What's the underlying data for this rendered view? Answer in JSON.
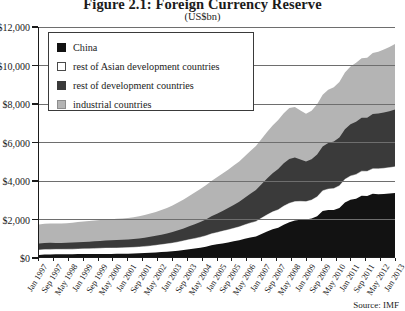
{
  "chart_data": {
    "type": "area",
    "stacked": true,
    "title": "Figure 2.1: Foreign Currency Reserve",
    "subtitle": "(US$bn)",
    "xlabel": "",
    "ylabel": "",
    "ylim": [
      0,
      12000
    ],
    "grid": true,
    "legend_position": "top-left",
    "source": "Source: IMF",
    "ytick_labels": [
      "$0",
      "$2,000",
      "$4,000",
      "$6,000",
      "$8,000",
      "$10,000",
      "$12,000"
    ],
    "ytick_values": [
      0,
      2000,
      4000,
      6000,
      8000,
      10000,
      12000
    ],
    "xtick_labels": [
      "Jan 1997",
      "Sep 1997",
      "May 1998",
      "Jan 1999",
      "Sep 1999",
      "May 2000",
      "Jan 2001",
      "Sep 2001",
      "May 2002",
      "Jan 2003",
      "Sep 2003",
      "May 2004",
      "Jan 2005",
      "Sep 2005",
      "May 2006",
      "Jan 2007",
      "Sep 2007",
      "May 2008",
      "Jan 2009",
      "Sep 2009",
      "May 2010",
      "Jan 2011",
      "Sep 2011",
      "May 2012",
      "Jan 2013"
    ],
    "x": [
      1997.0,
      1997.25,
      1997.5,
      1997.75,
      1998.0,
      1998.25,
      1998.5,
      1998.75,
      1999.0,
      1999.25,
      1999.5,
      1999.75,
      2000.0,
      2000.25,
      2000.5,
      2000.75,
      2001.0,
      2001.25,
      2001.5,
      2001.75,
      2002.0,
      2002.25,
      2002.5,
      2002.75,
      2003.0,
      2003.25,
      2003.5,
      2003.75,
      2004.0,
      2004.25,
      2004.5,
      2004.75,
      2005.0,
      2005.25,
      2005.5,
      2005.75,
      2006.0,
      2006.25,
      2006.5,
      2006.75,
      2007.0,
      2007.25,
      2007.5,
      2007.75,
      2008.0,
      2008.25,
      2008.5,
      2008.75,
      2009.0,
      2009.25,
      2009.5,
      2009.75,
      2010.0,
      2010.25,
      2010.5,
      2010.75,
      2011.0,
      2011.25,
      2011.5,
      2011.75,
      2012.0,
      2012.25,
      2012.5,
      2012.75,
      2013.0
    ],
    "series": [
      {
        "name": "China",
        "color": "#121212",
        "values": [
          110,
          125,
          135,
          140,
          145,
          146,
          148,
          150,
          152,
          154,
          156,
          158,
          160,
          162,
          164,
          168,
          175,
          185,
          198,
          212,
          225,
          240,
          258,
          278,
          300,
          330,
          365,
          403,
          440,
          480,
          530,
          610,
          660,
          710,
          760,
          818,
          875,
          950,
          1020,
          1066,
          1200,
          1330,
          1450,
          1528,
          1680,
          1810,
          1900,
          1946,
          1950,
          2010,
          2130,
          2399,
          2450,
          2450,
          2560,
          2847,
          2990,
          3045,
          3200,
          3181,
          3300,
          3280,
          3290,
          3310,
          3340
        ]
      },
      {
        "name": "rest of Asian development countries",
        "color": "#ffffff",
        "values": [
          260,
          265,
          262,
          258,
          255,
          258,
          262,
          268,
          275,
          282,
          290,
          298,
          305,
          308,
          310,
          312,
          315,
          320,
          330,
          340,
          355,
          372,
          390,
          408,
          430,
          455,
          480,
          505,
          530,
          555,
          580,
          600,
          620,
          640,
          660,
          680,
          700,
          730,
          760,
          790,
          830,
          870,
          905,
          940,
          975,
          995,
          990,
          960,
          940,
          965,
          1010,
          1060,
          1100,
          1125,
          1160,
          1205,
          1240,
          1265,
          1280,
          1290,
          1310,
          1325,
          1340,
          1355,
          1370
        ]
      },
      {
        "name": "rest of development countries",
        "color": "#3a3a3a",
        "values": [
          340,
          345,
          342,
          338,
          335,
          338,
          342,
          348,
          356,
          364,
          372,
          380,
          392,
          400,
          408,
          414,
          420,
          428,
          440,
          455,
          472,
          492,
          515,
          540,
          570,
          605,
          645,
          690,
          735,
          790,
          850,
          915,
          980,
          1055,
          1135,
          1220,
          1310,
          1415,
          1525,
          1640,
          1760,
          1890,
          2010,
          2120,
          2230,
          2310,
          2300,
          2180,
          2090,
          2120,
          2210,
          2310,
          2400,
          2455,
          2520,
          2610,
          2690,
          2750,
          2790,
          2800,
          2850,
          2880,
          2910,
          2940,
          2980
        ]
      },
      {
        "name": "industrial countries",
        "color": "#b4b4b4",
        "values": [
          990,
          1000,
          1005,
          1010,
          1015,
          1025,
          1040,
          1055,
          1070,
          1080,
          1090,
          1095,
          1100,
          1105,
          1110,
          1115,
          1125,
          1140,
          1160,
          1185,
          1215,
          1250,
          1290,
          1335,
          1390,
          1450,
          1515,
          1585,
          1655,
          1720,
          1785,
          1845,
          1900,
          1950,
          2000,
          2050,
          2100,
          2160,
          2225,
          2290,
          2360,
          2430,
          2500,
          2560,
          2620,
          2660,
          2640,
          2560,
          2500,
          2540,
          2620,
          2700,
          2780,
          2830,
          2890,
          2960,
          3020,
          3070,
          3100,
          3120,
          3180,
          3230,
          3290,
          3350,
          3420
        ]
      }
    ]
  },
  "legend": {
    "items": [
      {
        "label": "China",
        "swatch_class": "sw-china",
        "icon": "legend-swatch-black"
      },
      {
        "label": "rest of Asian development countries",
        "swatch_class": "sw-asian",
        "icon": "legend-swatch-white"
      },
      {
        "label": "rest of development countries",
        "swatch_class": "sw-restdev",
        "icon": "legend-swatch-darkgray"
      },
      {
        "label": "industrial countries",
        "swatch_class": "sw-indus",
        "icon": "legend-swatch-lightgray"
      }
    ]
  },
  "colors": {
    "china": "#121212",
    "asian_dev": "#ffffff",
    "rest_dev": "#3a3a3a",
    "industrial": "#b4b4b4",
    "axis": "#1b1b1b",
    "grid": "#6e6e6e"
  }
}
